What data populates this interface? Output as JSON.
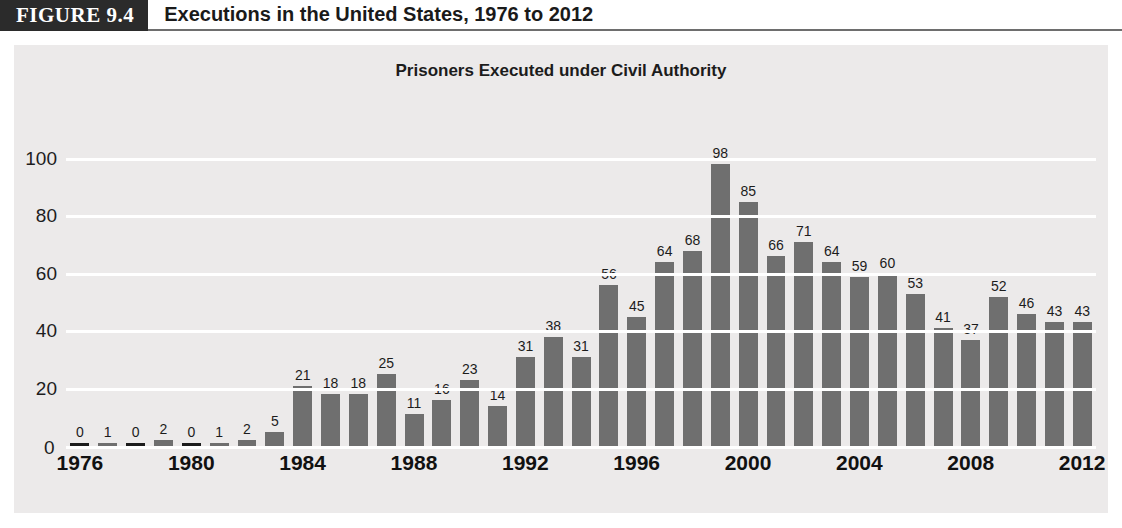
{
  "figure": {
    "tag": "FIGURE 9.4",
    "caption": "Executions in the United States, 1976 to 2012"
  },
  "chart_data": {
    "type": "bar",
    "title": "Prisoners Executed under Civil Authority",
    "xlabel": "",
    "ylabel": "",
    "ylim": [
      0,
      110
    ],
    "yticks": [
      0,
      20,
      40,
      60,
      80,
      100
    ],
    "grid": true,
    "legend": false,
    "bar_color": "#6f6f6f",
    "plot_background": "#eceaea",
    "categories": [
      "1976",
      "1977",
      "1978",
      "1979",
      "1980",
      "1981",
      "1982",
      "1983",
      "1984",
      "1985",
      "1986",
      "1987",
      "1988",
      "1989",
      "1990",
      "1991",
      "1992",
      "1993",
      "1994",
      "1995",
      "1996",
      "1997",
      "1998",
      "1999",
      "2000",
      "2001",
      "2002",
      "2003",
      "2004",
      "2005",
      "2006",
      "2007",
      "2008",
      "2009",
      "2010",
      "2011",
      "2012"
    ],
    "values": [
      0,
      1,
      0,
      2,
      0,
      1,
      2,
      5,
      21,
      18,
      18,
      25,
      11,
      16,
      23,
      14,
      31,
      38,
      31,
      56,
      45,
      64,
      68,
      98,
      85,
      66,
      71,
      64,
      59,
      60,
      53,
      41,
      37,
      52,
      46,
      43,
      43
    ],
    "xtick_labels": [
      "1976",
      "1980",
      "1984",
      "1988",
      "1992",
      "1996",
      "2000",
      "2004",
      "2008",
      "2012"
    ],
    "xtick_categories": [
      "1976",
      "1980",
      "1984",
      "1988",
      "1992",
      "1996",
      "2000",
      "2004",
      "2008",
      "2012"
    ],
    "data_labels_shown": true
  }
}
